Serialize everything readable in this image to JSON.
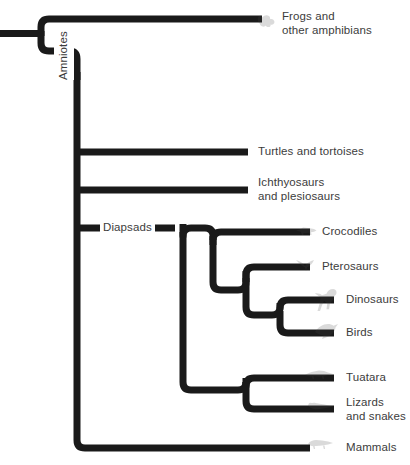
{
  "diagram": {
    "type": "cladogram",
    "background_color": "#ffffff",
    "branch_color": "#1a1a1a",
    "text_color": "#3c3c3c",
    "icon_opacity": 0.2
  },
  "node_labels": [
    {
      "id": "amniotes",
      "text": "Amniotes",
      "orientation": "vertical",
      "x": 74,
      "y": 130
    },
    {
      "id": "diapsads",
      "text": "Diapsads",
      "orientation": "horizontal",
      "x": 103,
      "y": 221
    }
  ],
  "tips": [
    {
      "id": "frogs",
      "text": "Frogs and\nother amphibians",
      "icon": "frog-icon",
      "label_x": 282,
      "label_y": 10,
      "icon_x": 256,
      "icon_y": 12,
      "branch_y": 19
    },
    {
      "id": "turtles",
      "text": "Turtles and tortoises",
      "icon": "turtle-icon",
      "label_x": 258,
      "label_y": 146,
      "icon_x": null,
      "icon_y": null,
      "branch_y": 152
    },
    {
      "id": "ichthyosaurs",
      "text": "Ichthyosaurs\nand plesiosaurs",
      "icon": "ichthyosaur-icon",
      "label_x": 258,
      "label_y": 177,
      "icon_x": null,
      "icon_y": null,
      "branch_y": 190
    },
    {
      "id": "crocodiles",
      "text": "Crocodiles",
      "icon": "crocodile-icon",
      "label_x": 322,
      "label_y": 226,
      "icon_x": 295,
      "icon_y": 224,
      "branch_y": 232
    },
    {
      "id": "pterosaurs",
      "text": "Pterosaurs",
      "icon": "pterosaur-icon",
      "label_x": 322,
      "label_y": 261,
      "icon_x": 295,
      "icon_y": 259,
      "branch_y": 267
    },
    {
      "id": "dinosaurs",
      "text": "Dinosaurs",
      "icon": "dinosaur-icon",
      "label_x": 346,
      "label_y": 294,
      "icon_x": 313,
      "icon_y": 289,
      "branch_y": 300
    },
    {
      "id": "birds",
      "text": "Birds",
      "icon": "bird-icon",
      "label_x": 346,
      "label_y": 327,
      "icon_x": 313,
      "icon_y": 322,
      "branch_y": 333
    },
    {
      "id": "tuatara",
      "text": "Tuatara",
      "icon": "tuatara-icon",
      "label_x": 346,
      "label_y": 372,
      "icon_x": 308,
      "icon_y": 370,
      "branch_y": 378
    },
    {
      "id": "lizards",
      "text": "Lizards\nand snakes",
      "icon": "lizard-icon",
      "label_x": 346,
      "label_y": 398,
      "icon_x": 308,
      "icon_y": 402,
      "branch_y": 409
    },
    {
      "id": "mammals",
      "text": "Mammals",
      "icon": "mammal-icon",
      "label_x": 346,
      "label_y": 442,
      "icon_x": 308,
      "icon_y": 440,
      "branch_y": 448
    }
  ],
  "internal_nodes": [
    {
      "id": "root",
      "x": 41,
      "y_top": 19,
      "y_bottom": 51
    },
    {
      "id": "amniote-stem",
      "x": 77,
      "y_top": 51,
      "y_bottom": 448
    },
    {
      "id": "diapsid",
      "x": 183,
      "y_top": 228,
      "y_bottom": 390
    },
    {
      "id": "archosaur",
      "x": 213,
      "y_top": 232,
      "y_bottom": 290
    },
    {
      "id": "pterosaur-dino",
      "x": 246,
      "y_top": 267,
      "y_bottom": 315
    },
    {
      "id": "dino-bird",
      "x": 280,
      "y_top": 300,
      "y_bottom": 333
    },
    {
      "id": "lepidosaur",
      "x": 246,
      "y_top": 378,
      "y_bottom": 409
    }
  ]
}
